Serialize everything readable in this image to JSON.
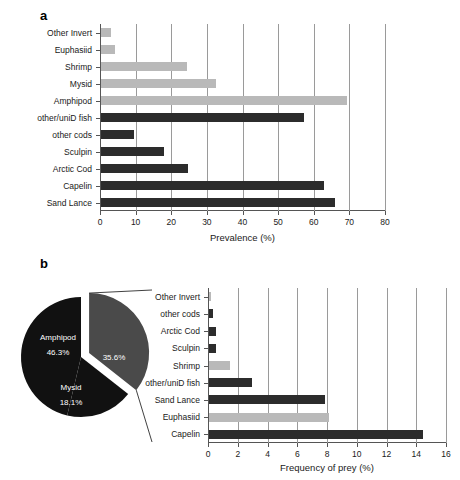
{
  "figure": {
    "panel_a_letter": "a",
    "panel_b_letter": "b"
  },
  "colors": {
    "invertebrate": "#b9b9b9",
    "fish": "#2c2c2c",
    "pie_dark": "#111111",
    "pie_gray": "#4a4a4a",
    "axis": "#555555",
    "grid": "#9a9a9a",
    "background": "#ffffff"
  },
  "chart_data": [
    {
      "type": "bar",
      "orientation": "horizontal",
      "panel": "a",
      "title": "",
      "xlabel": "Prevalence (%)",
      "ylabel": "",
      "xlim": [
        0,
        80
      ],
      "xticks": [
        0,
        10,
        20,
        30,
        40,
        50,
        60,
        70,
        80
      ],
      "grid": true,
      "legend": "none",
      "categories": [
        "Other Invert",
        "Euphasiid",
        "Shrimp",
        "Mysid",
        "Amphipod",
        "other/uniD fish",
        "other cods",
        "Sculpin",
        "Arctic Cod",
        "Capelin",
        "Sand Lance"
      ],
      "values": [
        2.7,
        4.0,
        24.0,
        32.2,
        69.0,
        57.0,
        9.4,
        17.6,
        24.3,
        62.6,
        65.6
      ],
      "groups": [
        "invertebrate",
        "invertebrate",
        "invertebrate",
        "invertebrate",
        "invertebrate",
        "fish",
        "fish",
        "fish",
        "fish",
        "fish",
        "fish"
      ]
    },
    {
      "type": "pie",
      "panel": "b",
      "title": "",
      "labels": [
        "Amphipod",
        "Mysid",
        "exploded"
      ],
      "values": [
        46.3,
        18.1,
        35.6
      ],
      "value_labels": [
        "46.3%",
        "18.1%",
        "35.6%"
      ],
      "exploded_index": 2,
      "slice_colors": [
        "#111111",
        "#111111",
        "#4a4a4a"
      ]
    },
    {
      "type": "bar",
      "orientation": "horizontal",
      "panel": "b",
      "title": "",
      "xlabel": "Frequency of prey (%)",
      "ylabel": "",
      "xlim": [
        0,
        16
      ],
      "xticks": [
        0,
        2,
        4,
        6,
        8,
        10,
        12,
        14,
        16
      ],
      "grid": true,
      "legend": "none",
      "categories": [
        "Other Invert",
        "other cods",
        "Arctic Cod",
        "Sculpin",
        "Shrimp",
        "other/uniD fish",
        "Sand Lance",
        "Euphasiid",
        "Capelin"
      ],
      "values": [
        0.15,
        0.3,
        0.45,
        0.45,
        1.4,
        2.9,
        7.8,
        8.1,
        14.4
      ],
      "groups": [
        "invertebrate",
        "fish",
        "fish",
        "fish",
        "invertebrate",
        "fish",
        "fish",
        "invertebrate",
        "fish"
      ]
    }
  ]
}
